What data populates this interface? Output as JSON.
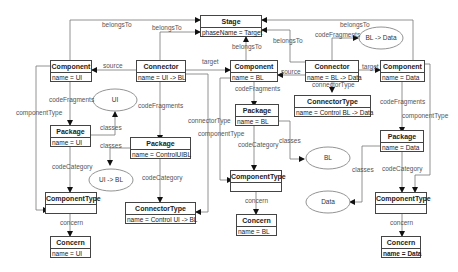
{
  "diagram": {
    "nodes": {
      "stage": {
        "title": "Stage",
        "attr": "phaseName = Target"
      },
      "comp_ui": {
        "title": "Component",
        "attr": "name = UI"
      },
      "conn_uibl": {
        "title": "Connector",
        "attr": "name = UI -> BL"
      },
      "comp_bl": {
        "title": "Component",
        "attr": "name = BL"
      },
      "conn_bldata": {
        "title": "Connector",
        "attr": "name = BL -> Data"
      },
      "comp_data": {
        "title": "Component",
        "attr": "name = Data"
      },
      "pkg_ui": {
        "title": "Package",
        "attr": "name = UI"
      },
      "pkg_ctrl": {
        "title": "Package",
        "attr": "name = ControlUIBL"
      },
      "pkg_bl": {
        "title": "Package",
        "attr": "name = BL"
      },
      "conntype_bldata": {
        "title": "ConnectorType",
        "attr": "name = Control BL -> Data"
      },
      "pkg_data": {
        "title": "Package",
        "attr": "name = Data"
      },
      "comptype_ui": {
        "title": "ComponentType",
        "attr": ""
      },
      "conntype_uibl": {
        "title": "ConnectorType",
        "attr": "name = Control UI -> BL"
      },
      "comptype_bl": {
        "title": "ComponentType",
        "attr": ""
      },
      "comptype_data": {
        "title": "ComponentType",
        "attr": ""
      },
      "concern_ui": {
        "title": "Concern",
        "attr": "name = UI"
      },
      "concern_bl": {
        "title": "Concern",
        "attr": "name = BL"
      },
      "concern_data": {
        "title": "Concern",
        "attr": "name = Data"
      }
    },
    "ellipses": {
      "ui": "UI",
      "uibl": "UI -> BL",
      "bl": "BL",
      "bldata": "BL -> Data",
      "data": "Data"
    },
    "edge_labels": {
      "belongs_to_1": "belongsTo",
      "belongs_to_2": "belongsTo",
      "belongs_to_3": "belongsTo",
      "belongs_to_4": "belongsTo",
      "belongs_to_5": "belongsTo",
      "source_1": "source",
      "target_1": "target",
      "source_2": "source",
      "target_2": "target",
      "code_fragments_1": "codeFragments",
      "code_fragments_2": "codeFragments",
      "code_fragments_3": "codeFragments",
      "code_fragments_4": "codeFragments",
      "code_fragments_5": "codeFragments",
      "component_type_1": "componentType",
      "component_type_2": "componentType",
      "component_type_3": "componentType",
      "connector_type_1": "connectorType",
      "connector_type_2": "connectorType",
      "classes_1": "classes",
      "classes_2": "classes",
      "classes_3": "classes",
      "classes_4": "classes",
      "code_category_1": "codeCategory",
      "code_category_2": "codeCategory",
      "code_category_3": "codeCategory",
      "code_category_4": "codeCategory",
      "concern_1": "concern",
      "concern_2": "concern",
      "concern_3": "concern"
    }
  }
}
